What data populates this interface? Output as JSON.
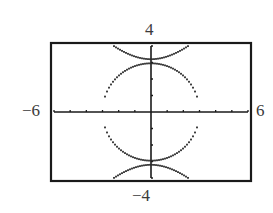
{
  "chart_data": {
    "type": "line",
    "title": "",
    "xlabel": "",
    "ylabel": "",
    "xlim": [
      -6,
      6
    ],
    "ylim": [
      -4,
      4
    ],
    "x_ticks_step": 1,
    "y_ticks_step": 1,
    "grid": false,
    "window_labels": {
      "xmin": "−6",
      "xmax": "6",
      "ymin": "−4",
      "ymax": "4"
    },
    "series": [
      {
        "name": "ellipse",
        "kind": "ellipse",
        "cx": 0,
        "cy": 0,
        "rx": 3.0,
        "ry": 2.95,
        "style": "dotted"
      },
      {
        "name": "hyperbola",
        "kind": "hyperbola-vertical",
        "a": 3.2,
        "b": 3.07,
        "style": "dotted"
      }
    ]
  },
  "colors": {
    "frame": "#1a1a1a",
    "curve": "#2a2a2a",
    "axis": "#1a1a1a",
    "label": "#3a3a3a"
  }
}
